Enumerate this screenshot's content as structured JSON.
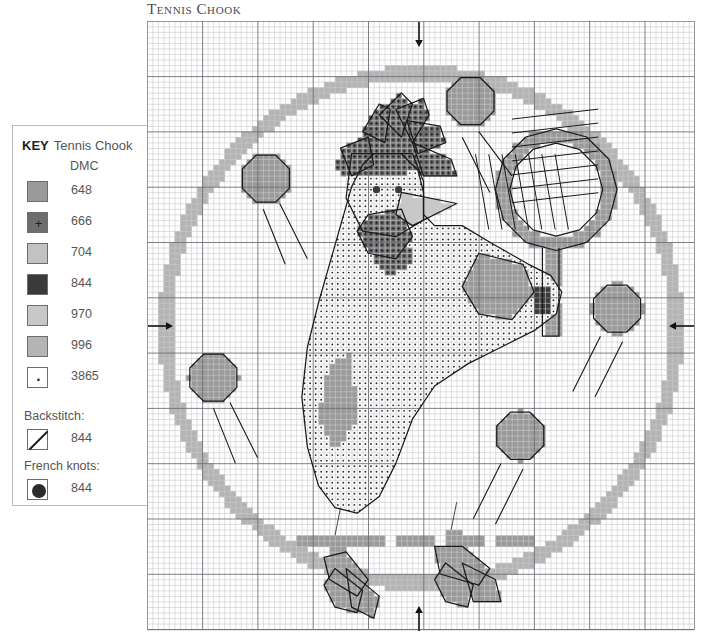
{
  "title": "Tennis Chook",
  "key": {
    "heading_word": "KEY",
    "heading_name": "Tennis Chook",
    "column_header": "DMC",
    "threads": [
      {
        "code": "648",
        "symbol": "",
        "color": "#9a9a9a"
      },
      {
        "code": "666",
        "symbol": "+",
        "color": "#6e6e6e"
      },
      {
        "code": "704",
        "symbol": "",
        "color": "#c2c2c2"
      },
      {
        "code": "844",
        "symbol": "",
        "color": "#3a3a3a"
      },
      {
        "code": "970",
        "symbol": "",
        "color": "#c8c8c8"
      },
      {
        "code": "996",
        "symbol": "",
        "color": "#b4b4b4"
      },
      {
        "code": "3865",
        "symbol": "·",
        "color": "#ffffff"
      }
    ],
    "backstitch_label": "Backstitch:",
    "backstitch_code": "844",
    "french_knots_label": "French knots:",
    "french_knots_code": "844"
  },
  "chart_data": {
    "type": "heatmap",
    "title": "Tennis Chook",
    "grid_cols": 99,
    "grid_rows": 110,
    "cell_px": 5.53,
    "bold_every": 10,
    "grid": true,
    "legend_position": "left",
    "palette": {
      "648": "#9a9a9a",
      "666": "#6e6e6e",
      "704": "#c2c2c2",
      "844": "#3a3a3a",
      "970": "#c8c8c8",
      "996": "#b4b4b4",
      "3865": "#ffffff"
    },
    "center_markers": [
      {
        "name": "top-center-arrow",
        "edge": "top",
        "col": 49
      },
      {
        "name": "bottom-center-arrow",
        "edge": "bottom",
        "col": 49
      },
      {
        "name": "left-center-arrow",
        "edge": "left",
        "row": 55
      },
      {
        "name": "right-center-arrow",
        "edge": "right",
        "row": 55
      }
    ],
    "regions": [
      {
        "name": "border-circle",
        "thread": "996",
        "shape": "ring",
        "cx": 49.5,
        "cy": 55.5,
        "r_outer": 47.5,
        "r_inner": 45.0
      },
      {
        "name": "tennis-ball-top-right",
        "thread": "648",
        "shape": "disc",
        "cx": 58.5,
        "cy": 14.5,
        "r": 4.6
      },
      {
        "name": "tennis-ball-left",
        "thread": "648",
        "shape": "disc",
        "cx": 21.5,
        "cy": 28.5,
        "r": 4.6
      },
      {
        "name": "tennis-ball-lower-left",
        "thread": "648",
        "shape": "disc",
        "cx": 12.0,
        "cy": 64.5,
        "r": 4.6
      },
      {
        "name": "tennis-ball-right",
        "thread": "648",
        "shape": "disc",
        "cx": 85.0,
        "cy": 52.0,
        "r": 4.6
      },
      {
        "name": "tennis-ball-bottom-right",
        "thread": "648",
        "shape": "disc",
        "cx": 67.5,
        "cy": 75.0,
        "r": 4.6
      },
      {
        "name": "racket-head-ring",
        "thread": "648",
        "shape": "ring",
        "cx": 74.0,
        "cy": 30.5,
        "r_outer": 11.0,
        "r_inner": 8.4
      },
      {
        "name": "racket-handle",
        "thread": "648",
        "shape": "rect",
        "x": 71.5,
        "y": 41.0,
        "w": 3.0,
        "h": 16.0
      },
      {
        "name": "body",
        "thread": "3865",
        "shape": "body-blob"
      },
      {
        "name": "comb",
        "thread": "666",
        "shape": "comb"
      },
      {
        "name": "wattle",
        "thread": "666",
        "shape": "wattle"
      },
      {
        "name": "beak",
        "thread": "970",
        "shape": "beak"
      },
      {
        "name": "tail-shadow",
        "thread": "648",
        "shape": "tail"
      },
      {
        "name": "grip-dark",
        "thread": "844",
        "shape": "grip"
      },
      {
        "name": "legs-feet",
        "thread": "648",
        "shape": "feet"
      },
      {
        "name": "ground-line",
        "thread": "648",
        "shape": "dashed-line",
        "row": 94,
        "x_start": 27,
        "x_end": 70
      }
    ],
    "french_knots": [
      {
        "name": "eye-left",
        "col": 41.5,
        "row": 30.5,
        "thread": "844"
      },
      {
        "name": "eye-right",
        "col": 45.5,
        "row": 30.5,
        "thread": "844"
      }
    ],
    "backstitch_lines": [
      {
        "name": "racket-strings",
        "thread": "844",
        "count": 12
      },
      {
        "name": "ball-motion-lines",
        "thread": "844",
        "count": 10
      },
      {
        "name": "body-outline",
        "thread": "844"
      },
      {
        "name": "feet-outline",
        "thread": "844"
      }
    ]
  }
}
